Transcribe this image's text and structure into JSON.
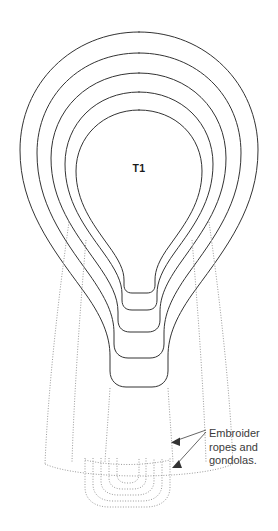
{
  "document": {
    "kind": "sewing-pattern-diagram",
    "subject": "hot air balloon",
    "background_color": "#ffffff"
  },
  "labels": {
    "tier_label": "T1"
  },
  "annotation": {
    "text": "Embroider ropes and gondolas.",
    "line_1": "Embroider",
    "line_2": "ropes and",
    "line_3": "gondolas.",
    "arrow_count": 2
  },
  "style": {
    "solid_line_color": "#333333",
    "dotted_line_color": "#9a9a9a",
    "text_color": "#3a3a3a",
    "label_color": "#1b1b1b",
    "arrow_color": "#333333"
  },
  "geometry": {
    "solid_contours": 5,
    "dotted_envelope_lines": 4,
    "dotted_gondola_rings": 5,
    "canvas": {
      "width": 278,
      "height": 531
    }
  }
}
